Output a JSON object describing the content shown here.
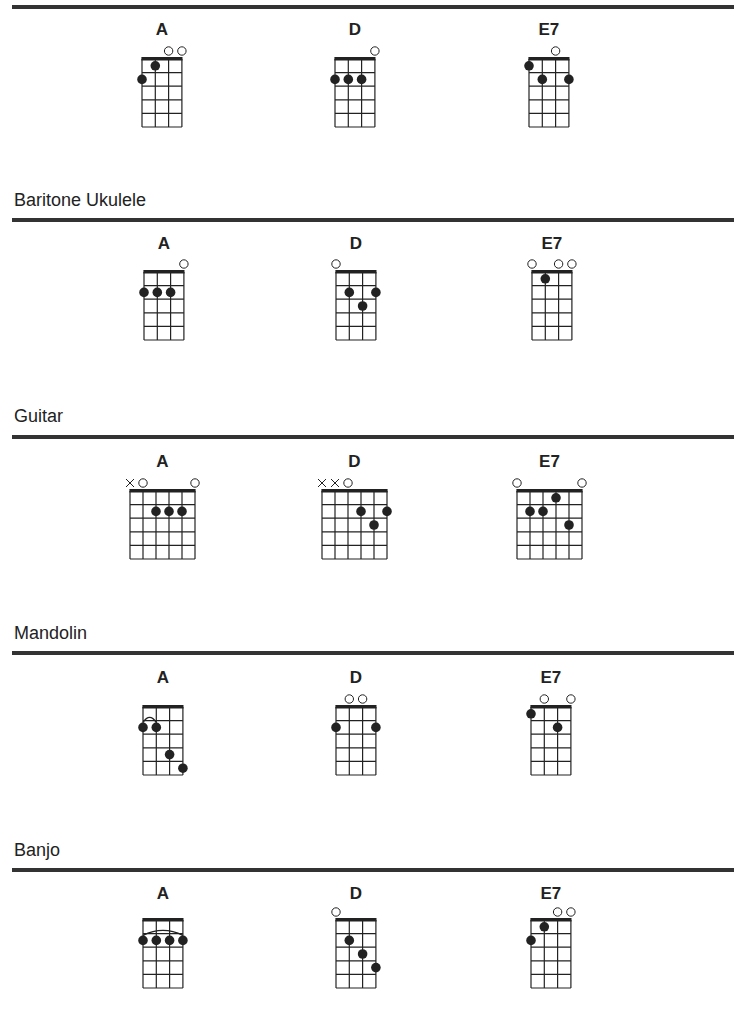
{
  "colors": {
    "rule": "#333333",
    "ink": "#222222",
    "background": "#ffffff"
  },
  "sections": [
    {
      "label": "",
      "rule_y": 5,
      "name_y": 20,
      "nut_y": 59,
      "strings": 4,
      "chords": [
        {
          "name": "A",
          "x": 142,
          "markers": [
            "",
            "",
            "o",
            "o"
          ],
          "dots": [
            [
              1,
              2
            ],
            [
              2,
              1
            ]
          ],
          "barre": null
        },
        {
          "name": "D",
          "x": 335,
          "markers": [
            "",
            "",
            "",
            "o"
          ],
          "dots": [
            [
              1,
              2
            ],
            [
              2,
              2
            ],
            [
              3,
              2
            ]
          ],
          "barre": null
        },
        {
          "name": "E7",
          "x": 529,
          "markers": [
            "",
            "",
            "o",
            ""
          ],
          "dots": [
            [
              1,
              1
            ],
            [
              2,
              2
            ],
            [
              4,
              2
            ]
          ],
          "barre": null
        }
      ]
    },
    {
      "label": "Baritone Ukulele",
      "label_y": 190,
      "rule_y": 218,
      "name_y": 234,
      "nut_y": 272,
      "strings": 4,
      "chords": [
        {
          "name": "A",
          "x": 144,
          "markers": [
            "",
            "",
            "",
            "o"
          ],
          "dots": [
            [
              1,
              2
            ],
            [
              2,
              2
            ],
            [
              3,
              2
            ]
          ],
          "barre": null
        },
        {
          "name": "D",
          "x": 336,
          "markers": [
            "o",
            "",
            "",
            ""
          ],
          "dots": [
            [
              2,
              2
            ],
            [
              3,
              3
            ],
            [
              4,
              2
            ]
          ],
          "barre": null
        },
        {
          "name": "E7",
          "x": 532,
          "markers": [
            "o",
            "",
            "o",
            "o"
          ],
          "dots": [
            [
              2,
              1
            ]
          ],
          "barre": null
        }
      ]
    },
    {
      "label": "Guitar",
      "label_y": 406,
      "rule_y": 435,
      "name_y": 452,
      "nut_y": 491,
      "strings": 6,
      "chords": [
        {
          "name": "A",
          "x": 130,
          "markers": [
            "x",
            "o",
            "",
            "",
            "",
            "o"
          ],
          "dots": [
            [
              3,
              2
            ],
            [
              4,
              2
            ],
            [
              5,
              2
            ]
          ],
          "barre": null
        },
        {
          "name": "D",
          "x": 322,
          "markers": [
            "x",
            "x",
            "o",
            "",
            "",
            ""
          ],
          "dots": [
            [
              4,
              2
            ],
            [
              5,
              3
            ],
            [
              6,
              2
            ]
          ],
          "barre": null
        },
        {
          "name": "E7",
          "x": 517,
          "markers": [
            "o",
            "",
            "",
            "",
            "",
            "o"
          ],
          "dots": [
            [
              2,
              2
            ],
            [
              3,
              2
            ],
            [
              4,
              1
            ],
            [
              5,
              3
            ]
          ],
          "barre": null
        }
      ]
    },
    {
      "label": "Mandolin",
      "label_y": 623,
      "rule_y": 651,
      "name_y": 668,
      "nut_y": 707,
      "strings": 4,
      "chords": [
        {
          "name": "A",
          "x": 143,
          "markers": [
            "",
            "",
            "",
            ""
          ],
          "dots": [
            [
              1,
              2
            ],
            [
              2,
              2
            ],
            [
              3,
              4
            ],
            [
              4,
              5
            ]
          ],
          "barre": {
            "fret": 2,
            "from": 1,
            "to": 2
          }
        },
        {
          "name": "D",
          "x": 336,
          "markers": [
            "",
            "o",
            "o",
            ""
          ],
          "dots": [
            [
              1,
              2
            ],
            [
              4,
              2
            ]
          ],
          "barre": null
        },
        {
          "name": "E7",
          "x": 531,
          "markers": [
            "",
            "o",
            "",
            "o"
          ],
          "dots": [
            [
              1,
              1
            ],
            [
              3,
              2
            ]
          ],
          "barre": null
        }
      ]
    },
    {
      "label": "Banjo",
      "label_y": 840,
      "rule_y": 868,
      "name_y": 884,
      "nut_y": 920,
      "strings": 4,
      "chords": [
        {
          "name": "A",
          "x": 143,
          "markers": [
            "",
            "",
            "",
            ""
          ],
          "dots": [
            [
              1,
              2
            ],
            [
              2,
              2
            ],
            [
              3,
              2
            ],
            [
              4,
              2
            ]
          ],
          "barre": {
            "fret": 2,
            "from": 1,
            "to": 4
          }
        },
        {
          "name": "D",
          "x": 336,
          "markers": [
            "o",
            "",
            "",
            ""
          ],
          "dots": [
            [
              2,
              2
            ],
            [
              3,
              3
            ],
            [
              4,
              4
            ]
          ],
          "barre": null
        },
        {
          "name": "E7",
          "x": 531,
          "markers": [
            "",
            "",
            "o",
            "o"
          ],
          "dots": [
            [
              1,
              2
            ],
            [
              2,
              1
            ]
          ],
          "barre": null
        }
      ]
    }
  ]
}
